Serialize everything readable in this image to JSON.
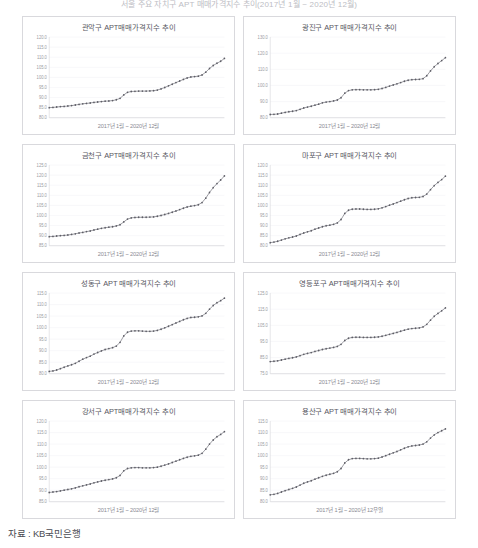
{
  "document": {
    "top_caption": "서울 주요 자치구 APT 매매가격지수 추이(2017년 1월 ~ 2020년 12월)",
    "source": "자료 : KB국민은행"
  },
  "common": {
    "xaxis_label": "2017년 1월 ~ 2020년 12월",
    "xaxis_label_last": "2017년 1월 ~ 2020년 12우얼"
  },
  "chart_data": [
    {
      "id": "gwanak",
      "type": "line",
      "title": "관악구 APT매매가격지수 추이",
      "xlabel": "2017년 1월 ~ 2020년 12월",
      "ylabel": "",
      "ylim": [
        80.0,
        120.0
      ],
      "yticks": [
        "120.0",
        "115.0",
        "110.0",
        "105.0",
        "100.0",
        "95.0",
        "90.0",
        "85.0",
        "80.0"
      ],
      "grid": true,
      "legend": "none",
      "x": [
        "2017-01",
        "2017-02",
        "2017-03",
        "2017-04",
        "2017-05",
        "2017-06",
        "2017-07",
        "2017-08",
        "2017-09",
        "2017-10",
        "2017-11",
        "2017-12",
        "2018-01",
        "2018-02",
        "2018-03",
        "2018-04",
        "2018-05",
        "2018-06",
        "2018-07",
        "2018-08",
        "2018-09",
        "2018-10",
        "2018-11",
        "2018-12",
        "2019-01",
        "2019-02",
        "2019-03",
        "2019-04",
        "2019-05",
        "2019-06",
        "2019-07",
        "2019-08",
        "2019-09",
        "2019-10",
        "2019-11",
        "2019-12",
        "2020-01",
        "2020-02",
        "2020-03",
        "2020-04",
        "2020-05",
        "2020-06",
        "2020-07",
        "2020-08",
        "2020-09",
        "2020-10",
        "2020-11",
        "2020-12"
      ],
      "values": [
        85.0,
        85.1,
        85.3,
        85.5,
        85.6,
        85.8,
        86.0,
        86.3,
        86.6,
        86.9,
        87.1,
        87.3,
        87.6,
        87.8,
        88.0,
        88.2,
        88.3,
        88.5,
        88.9,
        89.6,
        91.3,
        92.6,
        93.0,
        93.1,
        93.2,
        93.2,
        93.2,
        93.3,
        93.4,
        93.7,
        94.3,
        95.0,
        95.8,
        96.6,
        97.4,
        98.2,
        99.0,
        99.7,
        100.2,
        100.4,
        100.6,
        101.2,
        102.6,
        104.4,
        105.9,
        107.0,
        108.0,
        109.4
      ]
    },
    {
      "id": "gwangjin",
      "type": "line",
      "title": "광진구 APT 매매가격지수 추이",
      "xlabel": "2017년 1월 ~ 2020년 12월",
      "ylabel": "",
      "ylim": [
        80.0,
        130.0
      ],
      "yticks": [
        "130.0",
        "120.0",
        "110.0",
        "100.0",
        "90.0",
        "80.0"
      ],
      "grid": true,
      "legend": "none",
      "x": [
        "2017-01",
        "2017-02",
        "2017-03",
        "2017-04",
        "2017-05",
        "2017-06",
        "2017-07",
        "2017-08",
        "2017-09",
        "2017-10",
        "2017-11",
        "2017-12",
        "2018-01",
        "2018-02",
        "2018-03",
        "2018-04",
        "2018-05",
        "2018-06",
        "2018-07",
        "2018-08",
        "2018-09",
        "2018-10",
        "2018-11",
        "2018-12",
        "2019-01",
        "2019-02",
        "2019-03",
        "2019-04",
        "2019-05",
        "2019-06",
        "2019-07",
        "2019-08",
        "2019-09",
        "2019-10",
        "2019-11",
        "2019-12",
        "2020-01",
        "2020-02",
        "2020-03",
        "2020-04",
        "2020-05",
        "2020-06",
        "2020-07",
        "2020-08",
        "2020-09",
        "2020-10",
        "2020-11",
        "2020-12"
      ],
      "values": [
        82.0,
        82.1,
        82.3,
        82.8,
        83.3,
        83.7,
        84.0,
        84.4,
        85.2,
        86.0,
        86.6,
        87.1,
        87.8,
        88.4,
        89.2,
        89.7,
        90.0,
        90.4,
        91.0,
        92.4,
        95.2,
        96.8,
        97.3,
        97.4,
        97.4,
        97.3,
        97.3,
        97.3,
        97.4,
        97.6,
        98.1,
        98.8,
        99.6,
        100.3,
        101.0,
        101.8,
        102.6,
        103.2,
        103.6,
        103.7,
        103.8,
        104.2,
        106.0,
        109.0,
        111.6,
        113.6,
        115.4,
        117.2
      ]
    },
    {
      "id": "geumcheon",
      "type": "line",
      "title": "금천구 APT매매가격지수 추이",
      "xlabel": "2017년 1월 ~ 2020년 12월",
      "ylabel": "",
      "ylim": [
        85.0,
        125.0
      ],
      "yticks": [
        "125.0",
        "120.0",
        "115.0",
        "110.0",
        "105.0",
        "100.0",
        "95.0",
        "90.0",
        "85.0"
      ],
      "grid": true,
      "legend": "none",
      "x": [
        "2017-01",
        "2017-02",
        "2017-03",
        "2017-04",
        "2017-05",
        "2017-06",
        "2017-07",
        "2017-08",
        "2017-09",
        "2017-10",
        "2017-11",
        "2017-12",
        "2018-01",
        "2018-02",
        "2018-03",
        "2018-04",
        "2018-05",
        "2018-06",
        "2018-07",
        "2018-08",
        "2018-09",
        "2018-10",
        "2018-11",
        "2018-12",
        "2019-01",
        "2019-02",
        "2019-03",
        "2019-04",
        "2019-05",
        "2019-06",
        "2019-07",
        "2019-08",
        "2019-09",
        "2019-10",
        "2019-11",
        "2019-12",
        "2020-01",
        "2020-02",
        "2020-03",
        "2020-04",
        "2020-05",
        "2020-06",
        "2020-07",
        "2020-08",
        "2020-09",
        "2020-10",
        "2020-11",
        "2020-12"
      ],
      "values": [
        89.5,
        89.6,
        89.8,
        90.0,
        90.1,
        90.3,
        90.6,
        90.9,
        91.3,
        91.6,
        92.0,
        92.3,
        92.8,
        93.2,
        93.6,
        93.9,
        94.2,
        94.4,
        94.8,
        95.4,
        96.8,
        98.2,
        98.8,
        99.0,
        99.1,
        99.1,
        99.1,
        99.2,
        99.3,
        99.6,
        100.0,
        100.5,
        101.0,
        101.6,
        102.2,
        102.9,
        103.6,
        104.2,
        104.6,
        104.9,
        105.3,
        106.4,
        108.6,
        111.4,
        113.8,
        115.8,
        117.6,
        119.6
      ]
    },
    {
      "id": "mapo",
      "type": "line",
      "title": "마포구 APT 매매가격지수 추이",
      "xlabel": "2017년 1월 ~ 2020년 12월",
      "ylabel": "",
      "ylim": [
        80.0,
        120.0
      ],
      "yticks": [
        "120.0",
        "115.0",
        "110.0",
        "105.0",
        "100.0",
        "95.0",
        "90.0",
        "85.0",
        "80.0"
      ],
      "grid": true,
      "legend": "none",
      "x": [
        "2017-01",
        "2017-02",
        "2017-03",
        "2017-04",
        "2017-05",
        "2017-06",
        "2017-07",
        "2017-08",
        "2017-09",
        "2017-10",
        "2017-11",
        "2017-12",
        "2018-01",
        "2018-02",
        "2018-03",
        "2018-04",
        "2018-05",
        "2018-06",
        "2018-07",
        "2018-08",
        "2018-09",
        "2018-10",
        "2018-11",
        "2018-12",
        "2019-01",
        "2019-02",
        "2019-03",
        "2019-04",
        "2019-05",
        "2019-06",
        "2019-07",
        "2019-08",
        "2019-09",
        "2019-10",
        "2019-11",
        "2019-12",
        "2020-01",
        "2020-02",
        "2020-03",
        "2020-04",
        "2020-05",
        "2020-06",
        "2020-07",
        "2020-08",
        "2020-09",
        "2020-10",
        "2020-11",
        "2020-12"
      ],
      "values": [
        81.5,
        81.8,
        82.2,
        82.8,
        83.4,
        83.9,
        84.3,
        84.8,
        85.6,
        86.3,
        86.9,
        87.4,
        88.2,
        88.8,
        89.4,
        89.9,
        90.2,
        90.6,
        91.3,
        93.0,
        96.0,
        97.6,
        98.1,
        98.2,
        98.2,
        98.1,
        98.0,
        98.0,
        98.1,
        98.3,
        98.8,
        99.4,
        100.1,
        100.7,
        101.4,
        102.1,
        102.8,
        103.4,
        103.8,
        103.9,
        104.0,
        104.4,
        105.6,
        107.8,
        109.8,
        111.4,
        112.8,
        114.5
      ]
    },
    {
      "id": "seongdong",
      "type": "line",
      "title": "성동구 APT 매매가격지수 추이",
      "xlabel": "2017년 1월 ~ 2020년 12월",
      "ylabel": "",
      "ylim": [
        80.0,
        115.0
      ],
      "yticks": [
        "115.0",
        "110.0",
        "105.0",
        "100.0",
        "95.0",
        "90.0",
        "85.0",
        "80.0"
      ],
      "grid": true,
      "legend": "none",
      "x": [
        "2017-01",
        "2017-02",
        "2017-03",
        "2017-04",
        "2017-05",
        "2017-06",
        "2017-07",
        "2017-08",
        "2017-09",
        "2017-10",
        "2017-11",
        "2017-12",
        "2018-01",
        "2018-02",
        "2018-03",
        "2018-04",
        "2018-05",
        "2018-06",
        "2018-07",
        "2018-08",
        "2018-09",
        "2018-10",
        "2018-11",
        "2018-12",
        "2019-01",
        "2019-02",
        "2019-03",
        "2019-04",
        "2019-05",
        "2019-06",
        "2019-07",
        "2019-08",
        "2019-09",
        "2019-10",
        "2019-11",
        "2019-12",
        "2020-01",
        "2020-02",
        "2020-03",
        "2020-04",
        "2020-05",
        "2020-06",
        "2020-07",
        "2020-08",
        "2020-09",
        "2020-10",
        "2020-11",
        "2020-12"
      ],
      "values": [
        81.0,
        81.2,
        81.6,
        82.2,
        82.8,
        83.4,
        83.9,
        84.5,
        85.4,
        86.3,
        87.0,
        87.6,
        88.5,
        89.2,
        89.9,
        90.5,
        90.9,
        91.3,
        92.0,
        93.6,
        96.4,
        98.0,
        98.5,
        98.6,
        98.6,
        98.5,
        98.4,
        98.4,
        98.5,
        98.8,
        99.3,
        99.9,
        100.6,
        101.3,
        102.0,
        102.7,
        103.4,
        104.0,
        104.4,
        104.5,
        104.7,
        105.1,
        106.2,
        108.0,
        109.6,
        110.8,
        111.7,
        112.8
      ]
    },
    {
      "id": "yeongdeungpo",
      "type": "line",
      "title": "영등포구 APT매매가격지수 추이",
      "xlabel": "2017년 1월 ~ 2020년 12월",
      "ylabel": "",
      "ylim": [
        75.0,
        125.0
      ],
      "yticks": [
        "125.0",
        "115.0",
        "105.0",
        "95.0",
        "85.0",
        "75.0"
      ],
      "grid": true,
      "legend": "none",
      "x": [
        "2017-01",
        "2017-02",
        "2017-03",
        "2017-04",
        "2017-05",
        "2017-06",
        "2017-07",
        "2017-08",
        "2017-09",
        "2017-10",
        "2017-11",
        "2017-12",
        "2018-01",
        "2018-02",
        "2018-03",
        "2018-04",
        "2018-05",
        "2018-06",
        "2018-07",
        "2018-08",
        "2018-09",
        "2018-10",
        "2018-11",
        "2018-12",
        "2019-01",
        "2019-02",
        "2019-03",
        "2019-04",
        "2019-05",
        "2019-06",
        "2019-07",
        "2019-08",
        "2019-09",
        "2019-10",
        "2019-11",
        "2019-12",
        "2020-01",
        "2020-02",
        "2020-03",
        "2020-04",
        "2020-05",
        "2020-06",
        "2020-07",
        "2020-08",
        "2020-09",
        "2020-10",
        "2020-11",
        "2020-12"
      ],
      "values": [
        82.5,
        82.7,
        83.0,
        83.5,
        84.0,
        84.5,
        84.9,
        85.4,
        86.2,
        87.0,
        87.6,
        88.1,
        88.8,
        89.4,
        90.0,
        90.5,
        90.9,
        91.3,
        91.9,
        93.2,
        95.6,
        97.0,
        97.5,
        97.6,
        97.6,
        97.5,
        97.5,
        97.5,
        97.6,
        97.8,
        98.2,
        98.8,
        99.4,
        100.0,
        100.6,
        101.3,
        102.0,
        102.6,
        103.0,
        103.2,
        103.4,
        104.0,
        105.6,
        108.2,
        110.6,
        112.4,
        114.0,
        115.8
      ]
    },
    {
      "id": "gangseo",
      "type": "line",
      "title": "강서구 APT매매가격지수 추이",
      "xlabel": "2017년 1월 ~ 2020년 12월",
      "ylabel": "",
      "ylim": [
        85.0,
        120.0
      ],
      "yticks": [
        "120.0",
        "115.0",
        "110.0",
        "105.0",
        "100.0",
        "95.0",
        "90.0",
        "85.0"
      ],
      "grid": true,
      "legend": "none",
      "x": [
        "2017-01",
        "2017-02",
        "2017-03",
        "2017-04",
        "2017-05",
        "2017-06",
        "2017-07",
        "2017-08",
        "2017-09",
        "2017-10",
        "2017-11",
        "2017-12",
        "2018-01",
        "2018-02",
        "2018-03",
        "2018-04",
        "2018-05",
        "2018-06",
        "2018-07",
        "2018-08",
        "2018-09",
        "2018-10",
        "2018-11",
        "2018-12",
        "2019-01",
        "2019-02",
        "2019-03",
        "2019-04",
        "2019-05",
        "2019-06",
        "2019-07",
        "2019-08",
        "2019-09",
        "2019-10",
        "2019-11",
        "2019-12",
        "2020-01",
        "2020-02",
        "2020-03",
        "2020-04",
        "2020-05",
        "2020-06",
        "2020-07",
        "2020-08",
        "2020-09",
        "2020-10",
        "2020-11",
        "2020-12"
      ],
      "values": [
        89.0,
        89.2,
        89.4,
        89.7,
        90.0,
        90.3,
        90.6,
        91.0,
        91.5,
        91.9,
        92.3,
        92.7,
        93.2,
        93.6,
        94.0,
        94.3,
        94.6,
        94.9,
        95.4,
        96.4,
        98.4,
        99.4,
        99.7,
        99.8,
        99.8,
        99.7,
        99.7,
        99.7,
        99.8,
        100.0,
        100.4,
        100.9,
        101.4,
        102.0,
        102.6,
        103.2,
        103.8,
        104.3,
        104.7,
        104.9,
        105.2,
        106.0,
        107.8,
        110.0,
        111.8,
        113.2,
        114.2,
        115.4
      ]
    },
    {
      "id": "yongsan",
      "type": "line",
      "title": "용산구 APT 매매가격지수 추이",
      "xlabel": "2017년 1월 ~ 2020년 12우얼",
      "ylabel": "",
      "ylim": [
        80.0,
        115.0
      ],
      "yticks": [
        "115.0",
        "110.0",
        "105.0",
        "100.0",
        "95.0",
        "90.0",
        "85.0",
        "80.0"
      ],
      "grid": true,
      "legend": "none",
      "x": [
        "2017-01",
        "2017-02",
        "2017-03",
        "2017-04",
        "2017-05",
        "2017-06",
        "2017-07",
        "2017-08",
        "2017-09",
        "2017-10",
        "2017-11",
        "2017-12",
        "2018-01",
        "2018-02",
        "2018-03",
        "2018-04",
        "2018-05",
        "2018-06",
        "2018-07",
        "2018-08",
        "2018-09",
        "2018-10",
        "2018-11",
        "2018-12",
        "2019-01",
        "2019-02",
        "2019-03",
        "2019-04",
        "2019-05",
        "2019-06",
        "2019-07",
        "2019-08",
        "2019-09",
        "2019-10",
        "2019-11",
        "2019-12",
        "2020-01",
        "2020-02",
        "2020-03",
        "2020-04",
        "2020-05",
        "2020-06",
        "2020-07",
        "2020-08",
        "2020-09",
        "2020-10",
        "2020-11",
        "2020-12"
      ],
      "values": [
        83.0,
        83.2,
        83.6,
        84.2,
        84.8,
        85.3,
        85.8,
        86.4,
        87.2,
        88.0,
        88.6,
        89.1,
        89.8,
        90.4,
        91.0,
        91.5,
        91.9,
        92.3,
        93.0,
        94.4,
        96.8,
        98.2,
        98.7,
        98.8,
        98.8,
        98.7,
        98.6,
        98.6,
        98.7,
        98.9,
        99.4,
        100.0,
        100.6,
        101.2,
        101.8,
        102.5,
        103.2,
        103.8,
        104.2,
        104.4,
        104.6,
        105.0,
        106.0,
        107.6,
        109.0,
        110.0,
        110.8,
        111.6
      ]
    }
  ]
}
